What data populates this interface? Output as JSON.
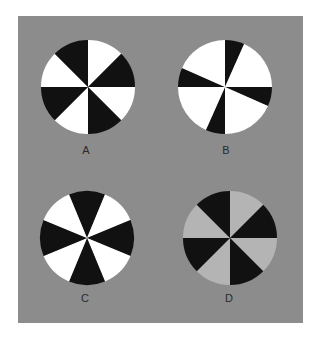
{
  "figure": {
    "background_color": "#8c8c8c",
    "panel": {
      "x": 18,
      "y": 16,
      "width": 285,
      "height": 307
    },
    "colors": {
      "black": "#111111",
      "white": "#ffffff",
      "light_gray": "#b4b4b4"
    },
    "pinwheels": [
      {
        "id": "A",
        "label": "A",
        "cx": 88,
        "cy": 87,
        "r": 47,
        "description": "8 equal 45° sectors alternating white/black, boundaries on cardinal and diagonal axes",
        "segments": [
          {
            "start": 0,
            "end": 45,
            "color": "white"
          },
          {
            "start": 45,
            "end": 90,
            "color": "black"
          },
          {
            "start": 90,
            "end": 135,
            "color": "white"
          },
          {
            "start": 135,
            "end": 180,
            "color": "black"
          },
          {
            "start": 180,
            "end": 225,
            "color": "white"
          },
          {
            "start": 225,
            "end": 270,
            "color": "black"
          },
          {
            "start": 270,
            "end": 315,
            "color": "white"
          },
          {
            "start": 315,
            "end": 360,
            "color": "black"
          }
        ],
        "label_x": 86,
        "label_y": 150
      },
      {
        "id": "B",
        "label": "B",
        "cx": 225,
        "cy": 87,
        "r": 47,
        "description": "white disk with 4 narrow black wedges (~24°) starting at each cardinal direction going clockwise",
        "segments": [
          {
            "start": 0,
            "end": 24,
            "color": "black"
          },
          {
            "start": 24,
            "end": 90,
            "color": "white"
          },
          {
            "start": 90,
            "end": 114,
            "color": "black"
          },
          {
            "start": 114,
            "end": 180,
            "color": "white"
          },
          {
            "start": 180,
            "end": 204,
            "color": "black"
          },
          {
            "start": 204,
            "end": 270,
            "color": "white"
          },
          {
            "start": 270,
            "end": 294,
            "color": "black"
          },
          {
            "start": 294,
            "end": 360,
            "color": "white"
          }
        ],
        "label_x": 226,
        "label_y": 150
      },
      {
        "id": "C",
        "label": "C",
        "cx": 87,
        "cy": 238,
        "r": 47,
        "description": "8 equal 45° sectors, black sectors centered on cardinal directions",
        "segments": [
          {
            "start": -22.5,
            "end": 22.5,
            "color": "black"
          },
          {
            "start": 22.5,
            "end": 67.5,
            "color": "white"
          },
          {
            "start": 67.5,
            "end": 112.5,
            "color": "black"
          },
          {
            "start": 112.5,
            "end": 157.5,
            "color": "white"
          },
          {
            "start": 157.5,
            "end": 202.5,
            "color": "black"
          },
          {
            "start": 202.5,
            "end": 247.5,
            "color": "white"
          },
          {
            "start": 247.5,
            "end": 292.5,
            "color": "black"
          },
          {
            "start": 292.5,
            "end": 337.5,
            "color": "white"
          }
        ],
        "label_x": 85,
        "label_y": 298
      },
      {
        "id": "D",
        "label": "D",
        "cx": 230,
        "cy": 238,
        "r": 47,
        "description": "same layout as A but with light gray instead of white",
        "segments": [
          {
            "start": 0,
            "end": 45,
            "color": "light_gray"
          },
          {
            "start": 45,
            "end": 90,
            "color": "black"
          },
          {
            "start": 90,
            "end": 135,
            "color": "light_gray"
          },
          {
            "start": 135,
            "end": 180,
            "color": "black"
          },
          {
            "start": 180,
            "end": 225,
            "color": "light_gray"
          },
          {
            "start": 225,
            "end": 270,
            "color": "black"
          },
          {
            "start": 270,
            "end": 315,
            "color": "light_gray"
          },
          {
            "start": 315,
            "end": 360,
            "color": "black"
          }
        ],
        "label_x": 229,
        "label_y": 298
      }
    ]
  }
}
